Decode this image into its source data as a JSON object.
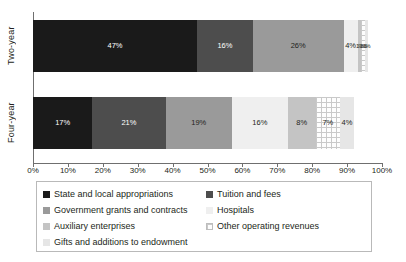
{
  "chart_data": {
    "type": "bar",
    "orientation": "horizontal",
    "stacked": true,
    "title": "",
    "xlabel": "",
    "ylabel": "",
    "xlim": [
      0,
      100
    ],
    "grid": false,
    "legend_position": "bottom",
    "categories": [
      "Two-year",
      "Four-year"
    ],
    "xticks": [
      "0%",
      "10%",
      "20%",
      "30%",
      "40%",
      "50%",
      "60%",
      "70%",
      "80%",
      "90%",
      "100%"
    ],
    "xtick_values": [
      0,
      10,
      20,
      30,
      40,
      50,
      60,
      70,
      80,
      90,
      100
    ],
    "series": [
      {
        "name": "State and local appropriations",
        "color": "#1a1a1a",
        "values": [
          47,
          17
        ],
        "labels": [
          "47%",
          "17%"
        ]
      },
      {
        "name": "Tuition and fees",
        "color": "#4d4d4d",
        "values": [
          16,
          21
        ],
        "labels": [
          "16%",
          "21%"
        ]
      },
      {
        "name": "Government grants and contracts",
        "color": "#9a9a9a",
        "values": [
          26,
          19
        ],
        "labels": [
          "26%",
          "19%"
        ]
      },
      {
        "name": "Hospitals",
        "color": "#efefef",
        "values": [
          4,
          16
        ],
        "labels": [
          "4%",
          "16%"
        ]
      },
      {
        "name": "Auxiliary enterprises",
        "color": "#c4c4c4",
        "values": [
          1,
          8
        ],
        "labels": [
          "1%",
          "8%"
        ]
      },
      {
        "name": "Other operating revenues",
        "color": "#fdfdfd",
        "pattern": "grid",
        "values": [
          1,
          7
        ],
        "labels": [
          "1%",
          "7%"
        ]
      },
      {
        "name": "Gifts and additions to endowment",
        "color": "#e6e6e6",
        "values": [
          1,
          4
        ],
        "labels": [
          "1%",
          "4%"
        ]
      }
    ]
  },
  "legend": {
    "items": [
      {
        "label": "State and local appropriations",
        "color": "#1a1a1a",
        "pattern": "solid"
      },
      {
        "label": "Tuition and fees",
        "color": "#4d4d4d",
        "pattern": "solid"
      },
      {
        "label": "Government grants and contracts",
        "color": "#9a9a9a",
        "pattern": "solid"
      },
      {
        "label": "Hospitals",
        "color": "#efefef",
        "pattern": "solid"
      },
      {
        "label": "Auxiliary enterprises",
        "color": "#c4c4c4",
        "pattern": "solid"
      },
      {
        "label": "Other operating revenues",
        "color": "#fdfdfd",
        "pattern": "grid"
      },
      {
        "label": "Gifts and additions to endowment",
        "color": "#e6e6e6",
        "pattern": "solid"
      }
    ]
  },
  "axis": {
    "category_labels": [
      "Two-year",
      "Four-year"
    ]
  }
}
